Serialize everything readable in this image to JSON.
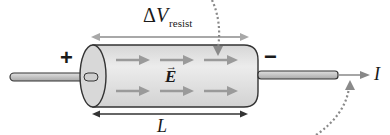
{
  "diagram": {
    "labels": {
      "potential_difference": {
        "symbol": "ΔV",
        "delta": "Δ",
        "main": "V",
        "subscript": "resist"
      },
      "electric_field": {
        "symbol": "E",
        "vector_mark": "→"
      },
      "length": "L",
      "current": "I",
      "positive_terminal": "+",
      "negative_terminal": "−"
    },
    "elements": {
      "cylinder": {
        "fill": "#e4e4e4",
        "stroke": "#333333"
      },
      "wires": {
        "fill": "#c8c8c8",
        "stroke": "#333333"
      },
      "field_arrows": {
        "count": 6,
        "rows": 2,
        "per_row": 3,
        "color": "#9a9a9a"
      },
      "dv_arrow_color": "#a8a8a8",
      "length_arrow_color": "#333333",
      "dotted_pointers": 2,
      "dotted_color": "#8a8a8a"
    }
  }
}
